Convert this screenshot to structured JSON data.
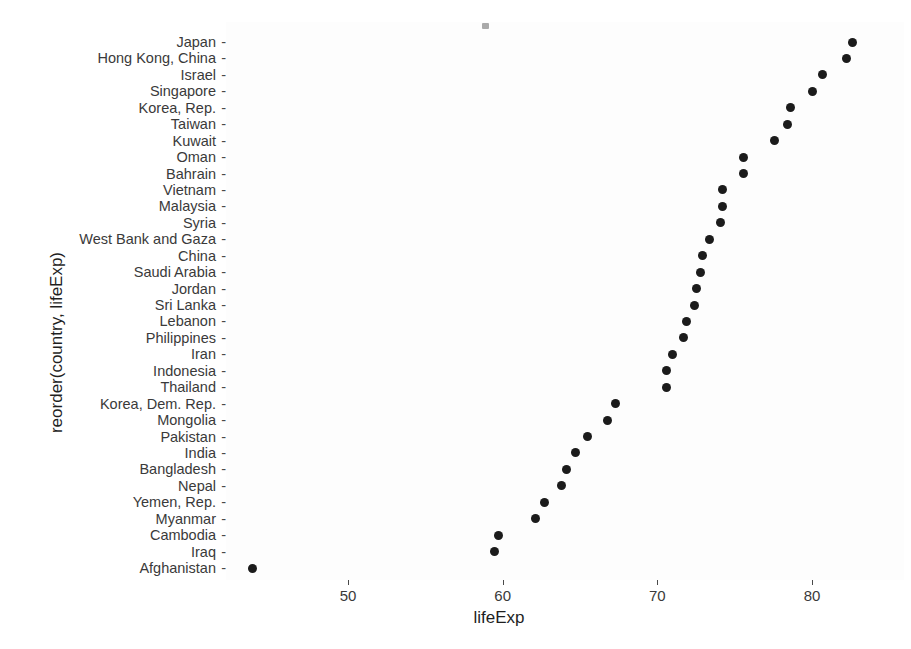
{
  "chart_data": {
    "type": "scatter",
    "title": "",
    "xlabel": "lifeExp",
    "ylabel": "reorder(country, lifeExp)",
    "xlim": [
      43.0,
      83.6
    ],
    "xticks": [
      50,
      60,
      70,
      80
    ],
    "xtick_labels": [
      "50",
      "60",
      "70",
      "80"
    ],
    "grid": false,
    "legend": "none",
    "marker": "filled-circle",
    "marker_color": "#1b1b1b",
    "panel_background": "#fdfdfd",
    "orientation": "horizontal-dotplot",
    "categories": [
      "Japan",
      "Hong Kong, China",
      "Israel",
      "Singapore",
      "Korea, Rep.",
      "Taiwan",
      "Kuwait",
      "Oman",
      "Bahrain",
      "Vietnam",
      "Malaysia",
      "Syria",
      "West Bank and Gaza",
      "China",
      "Saudi Arabia",
      "Jordan",
      "Sri Lanka",
      "Lebanon",
      "Philippines",
      "Iran",
      "Indonesia",
      "Thailand",
      "Korea, Dem. Rep.",
      "Mongolia",
      "Pakistan",
      "India",
      "Bangladesh",
      "Nepal",
      "Yemen, Rep.",
      "Myanmar",
      "Cambodia",
      "Iraq",
      "Afghanistan"
    ],
    "values": [
      82.6,
      82.2,
      80.7,
      80.0,
      78.6,
      78.4,
      77.6,
      75.6,
      75.6,
      74.2,
      74.2,
      74.1,
      73.4,
      72.9,
      72.8,
      72.5,
      72.4,
      71.9,
      71.7,
      71.0,
      70.6,
      70.6,
      67.3,
      66.8,
      65.5,
      64.7,
      64.1,
      63.8,
      62.7,
      62.1,
      59.7,
      59.5,
      43.8
    ],
    "tick_dash": "-"
  }
}
